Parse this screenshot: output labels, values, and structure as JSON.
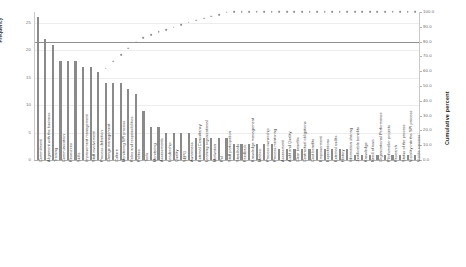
{
  "chart_data": {
    "type": "bar",
    "title": "",
    "xlabel": "",
    "ylabel": "Frequency",
    "y2label": "Cumulative percent",
    "ylim": [
      0,
      27
    ],
    "y2lim": [
      0,
      100
    ],
    "grid": true,
    "legend": "none",
    "yticks": [
      "0",
      "5",
      "10",
      "15",
      "20",
      "25"
    ],
    "ytick_values": [
      0,
      5,
      10,
      15,
      20,
      25
    ],
    "y2ticks": [
      "0.0",
      "10.0",
      "20.0",
      "30.0",
      "40.0",
      "50.0",
      "60.0",
      "70.0",
      "80.0",
      "90.0",
      "100.0"
    ],
    "y2tick_values": [
      0,
      10,
      20,
      30,
      40,
      50,
      60,
      70,
      80,
      90,
      100
    ],
    "reference_line": {
      "label": "80.0",
      "value": 80
    },
    "categories": [
      "Commitment",
      "Alignment with the business",
      "Training",
      "Communication",
      "Resources",
      "Skills",
      "Improvement management",
      "Staff involvement",
      "Process definition",
      "Change management",
      "Culture",
      "Monitoring SPI process",
      "Roles and responsibilities",
      "Politics",
      "Tools",
      "Monitoring",
      "Assessments",
      "Leadership",
      "Quality",
      "SEPG",
      "Awareness",
      "External Consultancy",
      "Learning organizational",
      "Motivation",
      "PoI",
      "Staff participation",
      "Standards",
      "Feedback",
      "Knowledge management",
      "Metrics",
      "Process ownership",
      "Process mentoring",
      "Assessment",
      "Audit and Quality",
      "Clear benefits",
      "Contractual obligations",
      "Cost benefits",
      "Empowerment",
      "Expectations",
      "External audits",
      "History",
      "Information sharing",
      "Justificable benefits",
      "Knowledge",
      "Need of own",
      "Organizational Performance",
      "Pilot/smaller projects",
      "Research",
      "Status of the process",
      "Visibility into the SPI process",
      "Visible success"
    ],
    "values": [
      26,
      22,
      21,
      18,
      18,
      18,
      17,
      17,
      16,
      14,
      14,
      14,
      13,
      12,
      9,
      6,
      6,
      5,
      5,
      5,
      5,
      4,
      4,
      4,
      4,
      4,
      3,
      3,
      3,
      3,
      3,
      3,
      2,
      2,
      2,
      2,
      2,
      2,
      2,
      2,
      2,
      2,
      1,
      1,
      1,
      1,
      1,
      1,
      1,
      1,
      1
    ],
    "cumulative_percent": [
      8.6,
      15.9,
      22.8,
      28.8,
      34.8,
      40.7,
      46.4,
      52.0,
      57.3,
      61.9,
      66.6,
      71.2,
      75.5,
      79.5,
      82.5,
      84.5,
      86.5,
      88.1,
      89.7,
      91.4,
      93.0,
      94.4,
      95.7,
      97.0,
      98.3,
      99.7,
      100.0,
      100.0,
      100.0,
      100.0,
      100.0,
      100.0,
      100.0,
      100.0,
      100.0,
      100.0,
      100.0,
      100.0,
      100.0,
      100.0,
      100.0,
      100.0,
      100.0,
      100.0,
      100.0,
      100.0,
      100.0,
      100.0,
      100.0,
      100.0,
      100.0
    ],
    "colors": {
      "bar": "#8a8a8a",
      "line": "#8d8d8d",
      "grid": "#ededed",
      "axis": "#b0b0b0",
      "text": "#4a4a4a"
    }
  }
}
